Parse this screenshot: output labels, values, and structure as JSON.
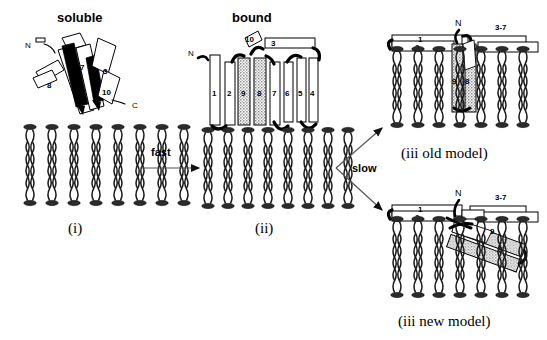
{
  "figure": {
    "title_soluble": "soluble",
    "title_bound": "bound",
    "panel_labels": {
      "i": "(i)",
      "ii": "(ii)",
      "iii_old": "(iii old model)",
      "iii_new": "(iii new model)"
    },
    "arrows": [
      {
        "name": "fast-arrow",
        "label": "fast",
        "direction": "right"
      },
      {
        "name": "slow-arrow",
        "label": "slow",
        "direction": "branch-up-down"
      }
    ],
    "soluble_structure": {
      "name": "soluble-protein-ribbon",
      "terminus_n": "N",
      "terminus_c": "C",
      "strand_labels": [
        "8",
        "7",
        "3",
        "10"
      ]
    },
    "bound_structure": {
      "name": "bound-protein-strands",
      "terminus_n": "N",
      "vertical_strand_labels": [
        "1",
        "2",
        "9",
        "8",
        "7",
        "6",
        "5",
        "4"
      ],
      "stippled_strands": [
        "9",
        "8"
      ],
      "top_strand_labels": [
        "10",
        "3"
      ]
    },
    "old_model": {
      "name": "old-model-panel",
      "terminus_n": "N",
      "surface_strand_labels": [
        "1",
        "2",
        "3-7"
      ],
      "inserted_strand_labels": [
        "9",
        "8"
      ],
      "insertion_orientation": "perpendicular"
    },
    "new_model": {
      "name": "new-model-panel",
      "terminus_n": "N",
      "surface_strand_labels": [
        "1",
        "2",
        "3-7"
      ],
      "inserted_strand_labels": [
        "9",
        "8"
      ],
      "insertion_orientation": "tilted"
    },
    "membranes": [
      {
        "name": "membrane-i",
        "lipid_count": 8
      },
      {
        "name": "membrane-ii",
        "lipid_count": 8
      },
      {
        "name": "membrane-old",
        "lipid_count": 8
      },
      {
        "name": "membrane-new",
        "lipid_count": 8
      }
    ],
    "colors": {
      "ink": "#000000",
      "strand_fill": "#ffffff",
      "stipple": "#9a9a9a",
      "lipid_head": "#2b2b2b",
      "arrow": "#555555",
      "background": "#ffffff"
    }
  }
}
